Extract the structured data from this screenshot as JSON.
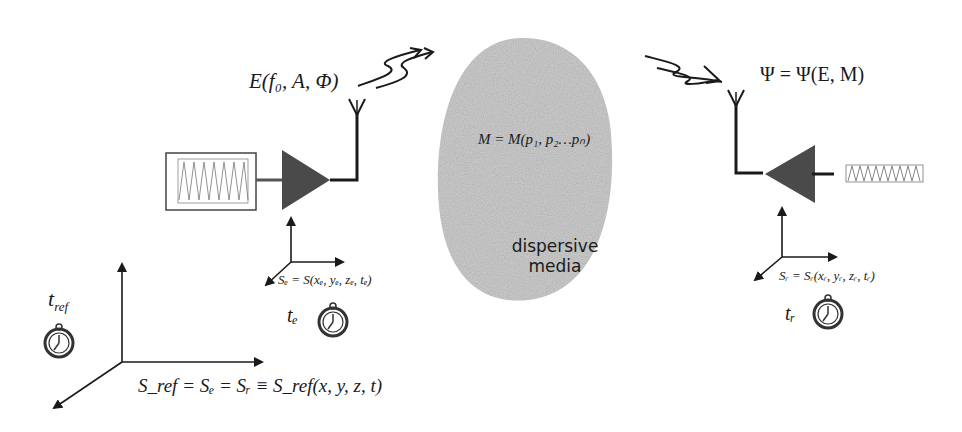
{
  "diagram": {
    "emitter": {
      "signal_label": "E(f₀, A, Φ)",
      "frame_label": "Sₑ = S(xₑ, yₑ, zₑ, tₑ)",
      "clock_label": "tₑ",
      "generator": "sine-wave-generator",
      "amplifier": "amplifier-triangle",
      "antenna": "transmit-antenna"
    },
    "medium": {
      "equation": "M = M(p₁, p₂…pₙ)",
      "label_line1": "dispersive",
      "label_line2": "media",
      "fill_color": "#c8c8c8"
    },
    "receiver": {
      "signal_label": "Ψ = Ψ(E, M)",
      "frame_label": "Sᵣ = Sᵣ(xᵣ, yᵣ, zᵣ, tᵣ)",
      "clock_label": "tᵣ",
      "amplifier": "amplifier-triangle",
      "antenna": "receive-antenna"
    },
    "reference": {
      "clock_label": "t_ref",
      "clock_label_main": "t",
      "clock_label_sub": "ref",
      "frame_label": "S_ref = Sₑ = Sᵣ ≡ S_ref(x, y, z, t)"
    },
    "colors": {
      "stroke": "#1a1a1a",
      "amplifier_fill": "#4a4a4a",
      "blob": "#cfcfcf"
    }
  }
}
